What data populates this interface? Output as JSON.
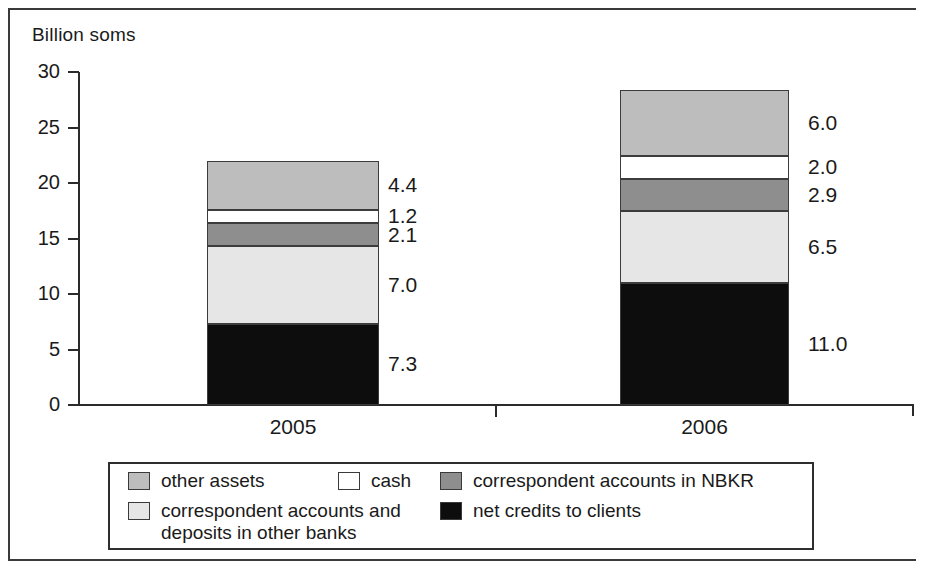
{
  "axis_title": "Billion soms",
  "colors": {
    "other_assets": "#bdbdbd",
    "cash": "#ffffff",
    "correspondent_nbkr": "#8e8e8e",
    "correspondent_other_banks": "#e6e6e6",
    "net_credits": "#0d0d0d",
    "axis": "#2b2b2b",
    "border": "#3c3c3c"
  },
  "legend": {
    "row1": [
      {
        "label": "other assets",
        "swatch": "other_assets"
      },
      {
        "label": "cash",
        "swatch": "cash"
      },
      {
        "label": "correspondent accounts in NBKR",
        "swatch": "correspondent_nbkr"
      }
    ],
    "row2": [
      {
        "label": "correspondent accounts and\ndeposits in other banks",
        "swatch": "correspondent_other_banks"
      },
      {
        "label": "net credits to clients",
        "swatch": "net_credits"
      }
    ]
  },
  "chart_data": {
    "type": "bar",
    "subtype": "stacked-vertical",
    "title": "",
    "xlabel": "",
    "ylabel": "Billion soms",
    "ylim": [
      0,
      30
    ],
    "yticks": [
      0,
      5,
      10,
      15,
      20,
      25,
      30
    ],
    "ytick_labels": [
      "0",
      "5",
      "10",
      "15",
      "20",
      "25",
      "30"
    ],
    "grid": false,
    "legend_position": "bottom",
    "categories": [
      "2005",
      "2006"
    ],
    "series": [
      {
        "name": "net credits to clients",
        "values": [
          7.3,
          11.0
        ],
        "labels": [
          "7.3",
          "11.0"
        ],
        "color": "net_credits"
      },
      {
        "name": "correspondent accounts and deposits in other banks",
        "values": [
          7.0,
          6.5
        ],
        "labels": [
          "7.0",
          "6.5"
        ],
        "color": "correspondent_other_banks"
      },
      {
        "name": "correspondent accounts in NBKR",
        "values": [
          2.1,
          2.9
        ],
        "labels": [
          "2.1",
          "2.9"
        ],
        "color": "correspondent_nbkr"
      },
      {
        "name": "cash",
        "values": [
          1.2,
          2.0
        ],
        "labels": [
          "1.2",
          "2.0"
        ],
        "color": "cash"
      },
      {
        "name": "other assets",
        "values": [
          4.4,
          6.0
        ],
        "labels": [
          "4.4",
          "6.0"
        ],
        "color": "other_assets"
      }
    ],
    "totals": [
      22.0,
      28.4
    ]
  }
}
